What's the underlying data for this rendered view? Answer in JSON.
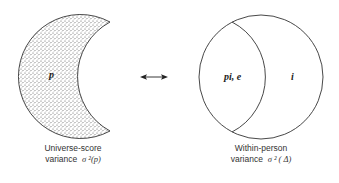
{
  "left_shape": {
    "region_label": "p",
    "caption_line1": "Universe-score",
    "caption_line2_prefix": "variance",
    "caption_symbol": "σ ²(p)"
  },
  "arrow": {
    "glyph": "double-headed-arrow"
  },
  "right_shape": {
    "left_region_label": "pi, e",
    "right_region_label": "i",
    "caption_line1": "Within-person",
    "caption_line2_prefix": "variance",
    "caption_symbol": "σ ² ( Δ)"
  },
  "colors": {
    "stroke": "#333333",
    "stipple": "#555555",
    "background": "#ffffff"
  }
}
